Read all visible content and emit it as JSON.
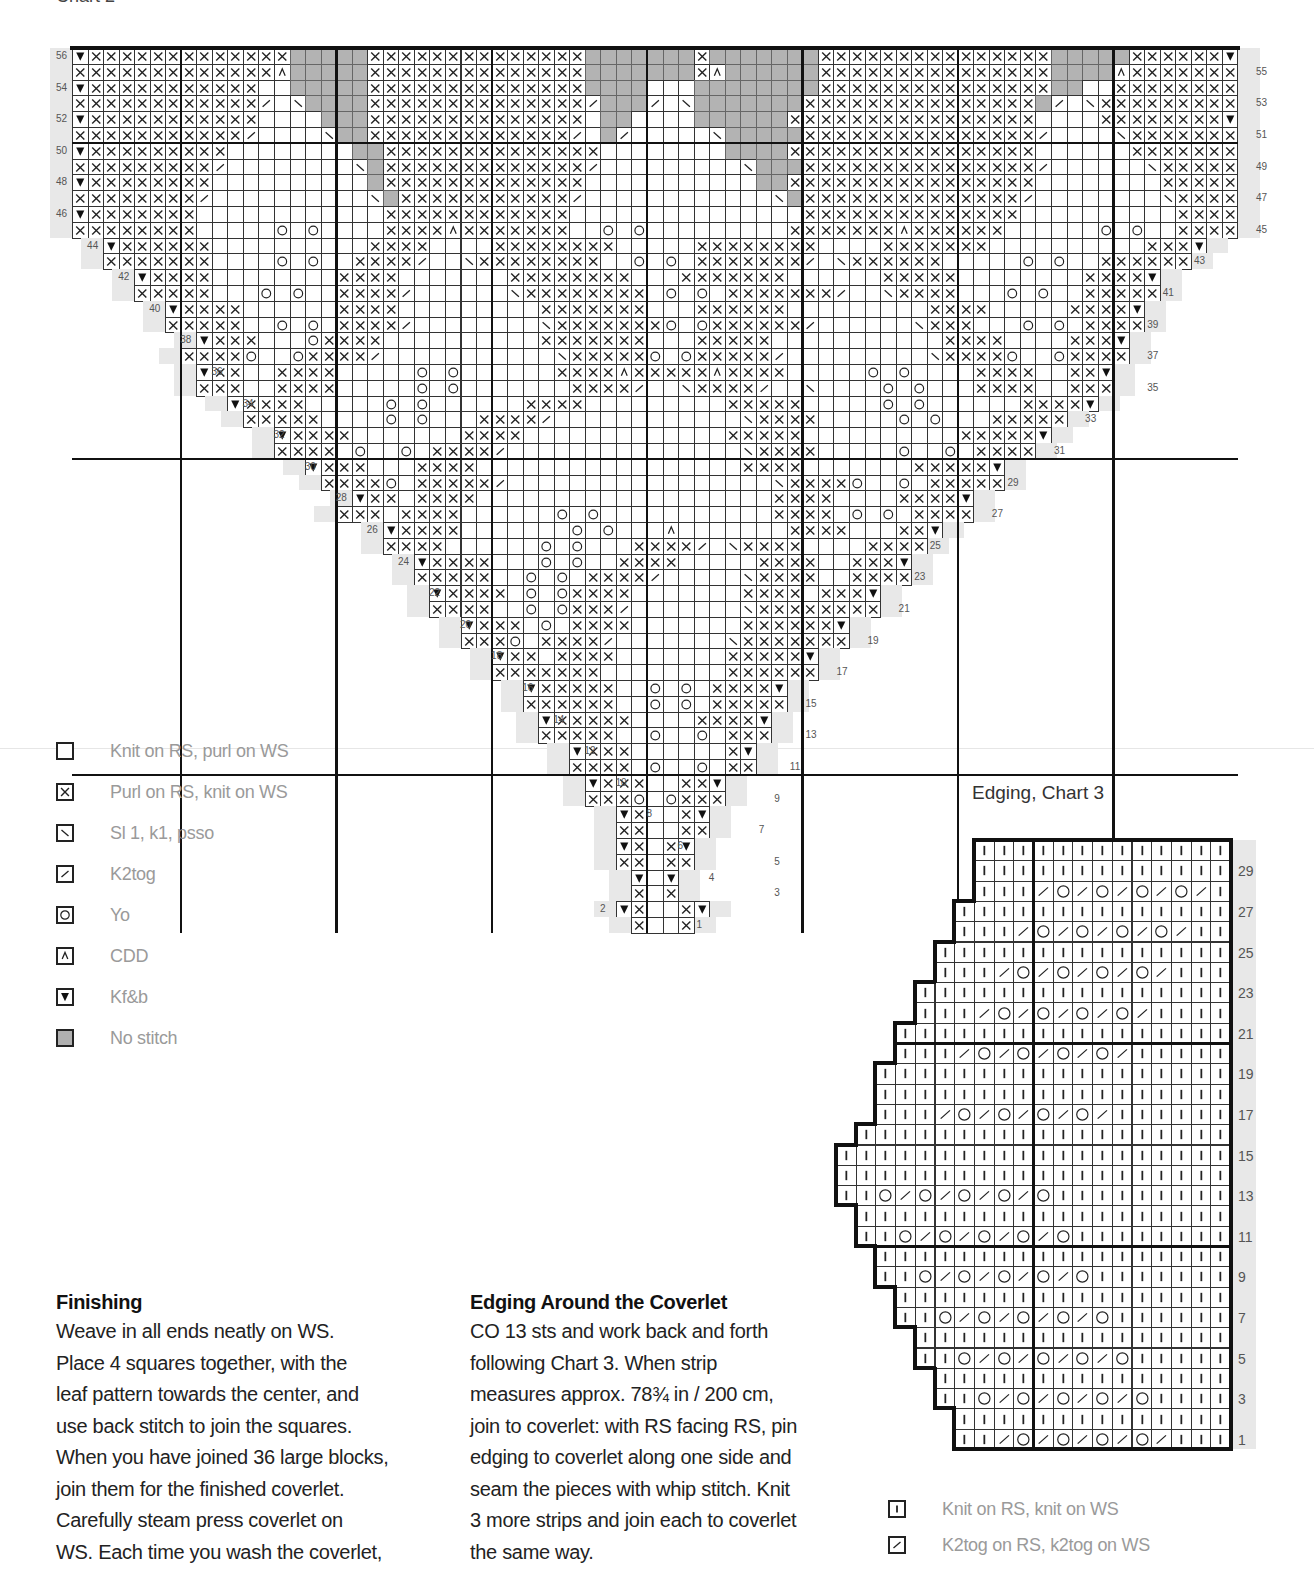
{
  "header": {
    "chart_title": "Chart 2"
  },
  "main_chart": {
    "cols": 75,
    "rows": 56,
    "origin_x": 72,
    "origin_y": 48,
    "cell_w": 15.54,
    "cell_h": 15.8,
    "bold_cols": [
      7,
      17,
      27,
      37,
      47,
      57,
      67
    ],
    "bold_rows_from_top": [
      6,
      26,
      46
    ],
    "row_labels_left": [
      56,
      54,
      52,
      50,
      48,
      46,
      44,
      42,
      40,
      38,
      36,
      34,
      32,
      30,
      28,
      26,
      24,
      22,
      20,
      18,
      16,
      14,
      12,
      10,
      8,
      6,
      4,
      2
    ],
    "row_labels_right": [
      55,
      53,
      51,
      49,
      47,
      45,
      43,
      41,
      39,
      37,
      35,
      33,
      31,
      29,
      27,
      25,
      23,
      21,
      19,
      17,
      15,
      13,
      11,
      9,
      7,
      5,
      3,
      1
    ],
    "note": "rows listed top (56) to bottom (1); each string = 75 chars: '.'=outside, ' '=knit, 'x'=purl, '\\\\'=ssk, '/'=k2tog, 'o'=yo, '^'=CDD, 'v'=kf&b, 'g'=no stitch",
    "grid": [
      "vxxxxxxxxxxxxxgggggxxxxxxxxxxxxxxgggggggxgggggggxxxxxxxxxxxxxxxgggggxxxxxxv",
      "xxxxxxxxxxxxx^gggggxxxxxxxxxxxxxxgggggggx^ggggggxxxxxxxxxxxxxxxgggg^xxxxxxxx",
      "vxxxxxxxxxxx  gggggxxxxxxxxxxxxxxgggg   ggggggggxxxxxxxxxxxxxxxgg  xxxxxxxxv",
      "xxxxxxxxxxxx/ \\ggggxxxxxxxxxxxxxx/ggg/ \\gggggggxxxxxxxxxxxxxxxg/ \\xxxxxxxxxx",
      "vxxxxxxxxxxx    gggxxxxxxxxxxxxxx gg    ggggggxxxxxxxxxxxxxxxx    xxxxxxxxv",
      "xxxxxxxxxxx/    \\ggxxxxxxxxxxxxx/ g/     \\gggggxxxxxxxxxxxxxxx/    \\xxxxxxxx",
      "vxxxxxxxxx        ggxxxxxxxxxxxxxx        ggggxxxxxxxxxxxxxxxx      xxxxxxxv",
      "xxxxxxxxx/        \\gxxxxxxxxxxxxx/         \\gggxxxxxxxxxxxxxxx/      \\xxxxxx",
      "vxxxxxxxx          gxxxxxxxxxxxxx           ggxxxxxxxxxxxxxxxx        xxxxxv",
      "xxxxxxxx/          \\gxxxxxxxxxxx/            \\gxxxxxxxxxxxxxx/        \\xxxxx",
      "vxxxxxxx            xxxxxxxxxxxx               xxxxxxxxxxxxxx          xxxxv",
      "xxxxxxxx     o o    xxxx^xxxxxxx  o o         xxxxxxx^xxxxxx      o o  xxxxx",
      "..vxxxxxx          xxxx    xxxxxxxx     xxxxxxxx    xxxxxxx          xxxv..",
      "..xxxxxxx    o o  xxxx/  \\xxxxxxxx  o o xxxxxxx/ \\xxxxxx     o o  xxxxxx..",
      "....vxxxx        xxxx       xxxxxxxx   xxxxxxx      xxxxx        xxxxv....",
      "....xxxxx   o o  xxxx/      \\xxxxxxxx o o xxxxxxx/  \\xxxx   o o  xxxxx....",
      "......vxxxx      xxxx         xxxxxxx   xxxxxx         xxxx     xxxxv......",
      "......xxxxx  o o xxxx/        \\xxxxxxxo oxxxxxx/      \\xxx   o o xxxx......",
      "........vxxx   oxxxx          xxxxxxx   xxxxx           xxxx    xxxv........",
      "........xxxxo  oxxxx/           \\xxxxxo oxxxxx/         \\xxxxo  oxxxx........",
      "..........vxx  xxxx     o o      xxxx^xxxxx^xxxx     o o    xxxx  xxv..........",
      "..........xxx  xxxx     o o       xxxx/  \\xxxx/  \\    o o   xxxx  xxx..........",
      "............vxxxx     o o      xxxx         xxxxx     o o      xxxxv............",
      "............xxxxx    o o   xxxx/            \\xxxx     o o   xxxxx............",
      "..............vxxxx       xxxx             xxxxx          xxxxxv..............",
      "..............xxxx o  o xxxx/               \\xxxx     o  o xxxx..............",
      "................vxxx   xxxx                 xxxx       xxxxxv................",
      "................xxxxo xxxxx/                 \\xxxxo  o xxxxx................",
      "..................vxx xxxx                   xxxx    xxxxv..................",
      "..................xxx xxxx      o o           xxxx o o xxxx..................",
      "....................vxxxx       o o   ^       xxxx   xxv....................",
      "....................xxxx      o o   xxxx/ \\xxxx    xxxx....................",
      "......................vxxxx   o o  xxxx     xxxx  xxxv......................",
      "......................xxxxx  o o xxxx/     \\xxxx  xxxx......................",
      "........................vxxxx o oxxxx       xxxx xxxv........................",
      "........................xxxx  o oxxx/       \\xxxxxxxx........................",
      "..........................vxxx o xxxx       xxxxxxv..........................",
      "..........................xxxo xxxx/       \\xxxxxxx..........................",
      "............................vxx xxxx       xxxxxv............................",
      "............................xxxxxxx        xxxxxx............................",
      "..............................vxxxxx  o o xxxxv..............................",
      "..............................xxxxxx  o o xxxxx..............................",
      "................................vxxxxx    xxxxv................................",
      "................................xxxxx  o  o xxx................................",
      "..................................vxxx      xv..................................",
      "..................................xxxx o  o xx..................................",
      "....................................vxxx  xxv....................................",
      "....................................xxxo oxxx....................................",
      "......................................vx  xv......................................",
      "......................................xx  xx......................................",
      "........................................vx xv........................................",
      "........................................xx xx........................................",
      "..........................................v v..........................................",
      "..........................................x x..........................................",
      "...................................vx  xv...................................",
      "....................................x  x...................................."
    ]
  },
  "legend": {
    "items": [
      {
        "symbol": "knit",
        "icon": "empty-square-icon",
        "label": "Knit on RS, purl on WS"
      },
      {
        "symbol": "purl",
        "icon": "x-square-icon",
        "label": "Purl on RS, knit on WS"
      },
      {
        "symbol": "ssk",
        "icon": "backslash-square-icon",
        "label": "Sl 1, k1, psso"
      },
      {
        "symbol": "k2tog",
        "icon": "slash-square-icon",
        "label": "K2tog"
      },
      {
        "symbol": "yo",
        "icon": "circle-square-icon",
        "label": "Yo"
      },
      {
        "symbol": "cdd",
        "icon": "caret-square-icon",
        "label": "CDD"
      },
      {
        "symbol": "kfb",
        "icon": "triangle-down-square-icon",
        "label": "Kf&b"
      },
      {
        "symbol": "nostitch",
        "icon": "gray-square-icon",
        "label": "No stitch"
      }
    ]
  },
  "edging_chart": {
    "title": "Edging, Chart 3",
    "origin_x": 836,
    "origin_y": 840,
    "cell_w": 19.7,
    "cell_h": 20.3,
    "cols": 20,
    "rows": 30,
    "bold_col": 10,
    "bold_rows_from_top": [
      10,
      20
    ],
    "row_labels": [
      29,
      27,
      25,
      23,
      21,
      19,
      17,
      15,
      13,
      11,
      9,
      7,
      5,
      3,
      1
    ],
    "note": "rows top (30) to bottom (1); 20 chars: '.'=outside, '|'=knit both sides, '/'=k2tog both sides, 'o'=yo",
    "grid": [
      ".......|||||||||||||",
      ".......|||||||||||||",
      ".......|||/o/o/o/o/|",
      "......||||||||||||||",
      "......|||/o/o/o/o/||",
      ".....|||||||||||||||",
      ".....|||/o/o/o/o/|||",
      "....||||||||||||||||",
      "....|||/o/o/o/o/||||",
      "...|||||||||||||||||",
      "...|||/o/o/o/o/|||||",
      "..||||||||||||||||||",
      "..||||||||||||||||||",
      "..|||/o/o/o/o/||||||",
      ".|||||||||||||||||||",
      "||||||||||||||||||||",
      "||||||||||||||||||||",
      "||o/o/o/o/o|||||||||",
      ".|||||||||||||||||||",
      ".||o/o/o/o/o||||||||",
      "..||||||||||||||||||",
      "..||o/o/o/o/o|||||||",
      "...|||||||||||||||||",
      "...||o/o/o/o/o||||||",
      "....||||||||||||||||",
      "....||o/o/o/o/o|||||",
      ".....|||||||||||||||",
      ".....||o/o/o/o/o||||",
      "......||||||||||||||",
      "......||/o/o/o/o/|||"
    ]
  },
  "finishing": {
    "heading": "Finishing",
    "lines": [
      "Weave in all ends neatly on WS.",
      "Place 4 squares together, with the",
      "leaf pattern towards the center, and",
      "use back stitch to join the squares.",
      "When you have joined 36 large blocks,",
      "join them for the finished coverlet.",
      "Carefully steam press coverlet on",
      "WS. Each time you wash the coverlet,"
    ]
  },
  "edging_section": {
    "heading": "Edging Around the Coverlet",
    "lines": [
      "CO 13 sts and work back and forth",
      "following Chart 3. When strip",
      "measures approx. 78¾ in / 200 cm,",
      "join to coverlet: with RS facing RS, pin",
      "edging to coverlet along one side and",
      "seam the pieces with whip stitch. Knit",
      "3 more strips and join each to coverlet",
      "the same way."
    ]
  },
  "legend2": {
    "items": [
      {
        "symbol": "knitbar",
        "icon": "bar-square-icon",
        "label": "Knit on RS, knit on WS"
      },
      {
        "symbol": "k2tog",
        "icon": "slash-square-icon",
        "label": "K2tog on RS, k2tog on WS"
      }
    ]
  },
  "colors": {
    "grid_line": "#333333",
    "bold_line": "#111111",
    "no_stitch": "#b3b3b3",
    "legend_text": "#9a9a9a",
    "shadow": "#e8e8e8"
  }
}
